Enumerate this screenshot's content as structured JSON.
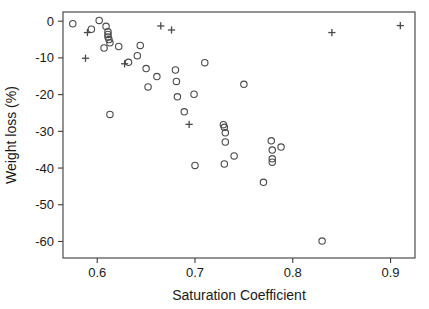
{
  "chart_data": {
    "type": "scatter",
    "title": "",
    "xlabel": "Saturation Coefficient",
    "ylabel": "Weight loss (%)",
    "xlim": [
      0.565,
      0.925
    ],
    "ylim": [
      -64.5,
      2.5
    ],
    "xticks": [
      0.6,
      0.7,
      0.8,
      0.9
    ],
    "xtick_labels": [
      "0.6",
      "0.7",
      "0.8",
      "0.9"
    ],
    "yticks": [
      0,
      -10,
      -20,
      -30,
      -40,
      -50,
      -60
    ],
    "ytick_labels": [
      "0",
      "-10",
      "-20",
      "-30",
      "-40",
      "-50",
      "-60"
    ],
    "grid": false,
    "legend": "none",
    "series": [
      {
        "name": "circle-series",
        "marker": "circle",
        "color": "#4a4a4a",
        "points": [
          [
            0.575,
            -0.7
          ],
          [
            0.594,
            -2.2
          ],
          [
            0.602,
            0.2
          ],
          [
            0.609,
            -1.4
          ],
          [
            0.611,
            -2.9
          ],
          [
            0.611,
            -3.6
          ],
          [
            0.611,
            -4.3
          ],
          [
            0.612,
            -5.0
          ],
          [
            0.613,
            -5.9
          ],
          [
            0.607,
            -7.3
          ],
          [
            0.613,
            -25.4
          ],
          [
            0.622,
            -6.9
          ],
          [
            0.632,
            -11.2
          ],
          [
            0.641,
            -9.4
          ],
          [
            0.644,
            -6.6
          ],
          [
            0.65,
            -12.9
          ],
          [
            0.652,
            -17.9
          ],
          [
            0.661,
            -15.1
          ],
          [
            0.68,
            -13.3
          ],
          [
            0.681,
            -16.4
          ],
          [
            0.682,
            -20.6
          ],
          [
            0.689,
            -24.7
          ],
          [
            0.699,
            -19.9
          ],
          [
            0.7,
            -39.3
          ],
          [
            0.71,
            -11.3
          ],
          [
            0.729,
            -28.2
          ],
          [
            0.73,
            -28.9
          ],
          [
            0.731,
            -30.4
          ],
          [
            0.731,
            -32.9
          ],
          [
            0.73,
            -38.9
          ],
          [
            0.74,
            -36.7
          ],
          [
            0.75,
            -17.2
          ],
          [
            0.77,
            -43.9
          ],
          [
            0.778,
            -32.6
          ],
          [
            0.779,
            -35.1
          ],
          [
            0.779,
            -37.5
          ],
          [
            0.779,
            -38.4
          ],
          [
            0.788,
            -34.3
          ],
          [
            0.83,
            -59.9
          ]
        ]
      },
      {
        "name": "plus-series",
        "marker": "plus",
        "color": "#4a4a4a",
        "points": [
          [
            0.59,
            -3.1
          ],
          [
            0.588,
            -10.1
          ],
          [
            0.628,
            -11.6
          ],
          [
            0.665,
            -1.3
          ],
          [
            0.676,
            -2.4
          ],
          [
            0.694,
            -28.1
          ],
          [
            0.84,
            -3.1
          ],
          [
            0.91,
            -1.2
          ]
        ]
      }
    ]
  },
  "axis": {
    "x_title": "Saturation Coefficient",
    "y_title": "Weight loss (%)"
  }
}
